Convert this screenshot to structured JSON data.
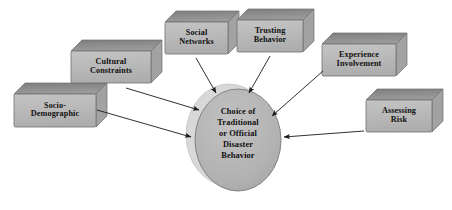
{
  "diagram": {
    "background_color": "#ffffff",
    "palette": {
      "box_front": "#b9b9b9",
      "box_top": "#8c8c8c",
      "box_side": "#a2a2a2",
      "box_outline": "#6f6f6f",
      "ellipse_fill": "#b3b3b3",
      "ellipse_shadow": "#d8d8d8",
      "ellipse_outline": "#7a7a7a",
      "arrow_color": "#1a1a1a",
      "text_color": "#111111"
    },
    "center": {
      "shape": "ellipse",
      "name": "choice-node",
      "text": "Choice of\nTraditional\nor Official\nDisaster\nBehavior",
      "lines": [
        "Choice of",
        "Traditional",
        "or Official",
        "Disaster",
        "Behavior"
      ],
      "cx": 238,
      "cy": 140,
      "rx": 43,
      "ry": 51
    },
    "boxes": [
      {
        "id": "socio-demographic",
        "text": "Socio-\nDemographic",
        "lines": [
          "Socio-",
          "Demographic"
        ],
        "x": 14,
        "y": 94,
        "w": 82,
        "h": 33,
        "depth": 11
      },
      {
        "id": "cultural-constraints",
        "text": "Cultural\nConstraints",
        "lines": [
          "Cultural",
          "Constraints"
        ],
        "x": 71,
        "y": 51,
        "w": 80,
        "h": 32,
        "depth": 11
      },
      {
        "id": "social-networks",
        "text": "Social\nNetworks",
        "lines": [
          "Social",
          "Networks"
        ],
        "x": 165,
        "y": 22,
        "w": 63,
        "h": 32,
        "depth": 11
      },
      {
        "id": "trusting-behavior",
        "text": "Trusting\nBehavior",
        "lines": [
          "Trusting",
          "Behavior"
        ],
        "x": 237,
        "y": 20,
        "w": 66,
        "h": 32,
        "depth": 11
      },
      {
        "id": "experience-involvement",
        "text": "Experience\nInvolvement",
        "lines": [
          "Experience",
          "Involvement"
        ],
        "x": 322,
        "y": 44,
        "w": 74,
        "h": 32,
        "depth": 11
      },
      {
        "id": "assessing-risk",
        "text": "Assessing\nRisk",
        "lines": [
          "Assessing",
          "Risk"
        ],
        "x": 366,
        "y": 100,
        "w": 66,
        "h": 32,
        "depth": 11
      }
    ],
    "arrows": [
      {
        "id": "socio-demographic-to-choice",
        "from": "socio-demographic",
        "to": "choice-node",
        "x1": 97,
        "y1": 110,
        "x2": 191,
        "y2": 137
      },
      {
        "id": "cultural-constraints-to-choice",
        "from": "cultural-constraints",
        "to": "choice-node",
        "x1": 126,
        "y1": 88,
        "x2": 199,
        "y2": 110
      },
      {
        "id": "social-networks-to-choice",
        "from": "social-networks",
        "to": "choice-node",
        "x1": 196,
        "y1": 58,
        "x2": 216,
        "y2": 93
      },
      {
        "id": "trusting-behavior-to-choice",
        "from": "trusting-behavior",
        "to": "choice-node",
        "x1": 270,
        "y1": 56,
        "x2": 249,
        "y2": 93
      },
      {
        "id": "experience-involvement-to-choice",
        "from": "experience-involvement",
        "to": "choice-node",
        "x1": 323,
        "y1": 71,
        "x2": 272,
        "y2": 116
      },
      {
        "id": "assessing-risk-to-choice",
        "from": "assessing-risk",
        "to": "choice-node",
        "x1": 364,
        "y1": 131,
        "x2": 284,
        "y2": 137
      }
    ]
  }
}
